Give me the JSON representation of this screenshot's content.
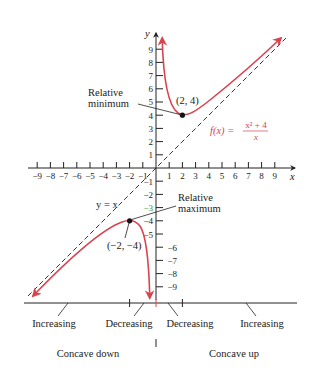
{
  "diagram": {
    "title": "",
    "function_label": "f(x) = (x^2 + 4) / x",
    "function_label_parts": {
      "lhs": "f(x) =",
      "numerator": "x² + 4",
      "denominator": "x"
    },
    "asymptote_label": "y = x",
    "x_axis_label": "x",
    "y_axis_label": "y",
    "x_ticks_negative": [
      "−9",
      "−8",
      "−7",
      "−6",
      "−5",
      "−4",
      "−3",
      "−2",
      "−1"
    ],
    "x_ticks_positive": [
      "1",
      "2",
      "3",
      "4",
      "5",
      "6",
      "7",
      "8",
      "9"
    ],
    "y_ticks_positive": [
      "1",
      "2",
      "3",
      "4",
      "5",
      "6",
      "7",
      "8",
      "9"
    ],
    "y_ticks_negative": [
      "−1",
      "−2",
      "−3",
      "−4",
      "−5",
      "−6",
      "−7",
      "−8",
      "−9"
    ],
    "relative_minimum": {
      "label_line1": "Relative",
      "label_line2": "minimum",
      "point_label": "(2, 4)",
      "x": 2,
      "y": 4
    },
    "relative_maximum": {
      "label_line1": "Relative",
      "label_line2": "maximum",
      "point_label": "(−2, −4)",
      "x": -2,
      "y": -4
    },
    "monotonicity": [
      "Increasing",
      "Decreasing",
      "Decreasing",
      "Increasing"
    ],
    "concavity": [
      "Concave down",
      "Concave up"
    ],
    "colors": {
      "curve": "#d9434f",
      "axis": "#222222",
      "asymptote": "#333333",
      "concave_down": "#3aa58a",
      "concave_up": "#b0506a",
      "function_label": "#d9434f",
      "tick_green": "#2e9a4a"
    }
  }
}
